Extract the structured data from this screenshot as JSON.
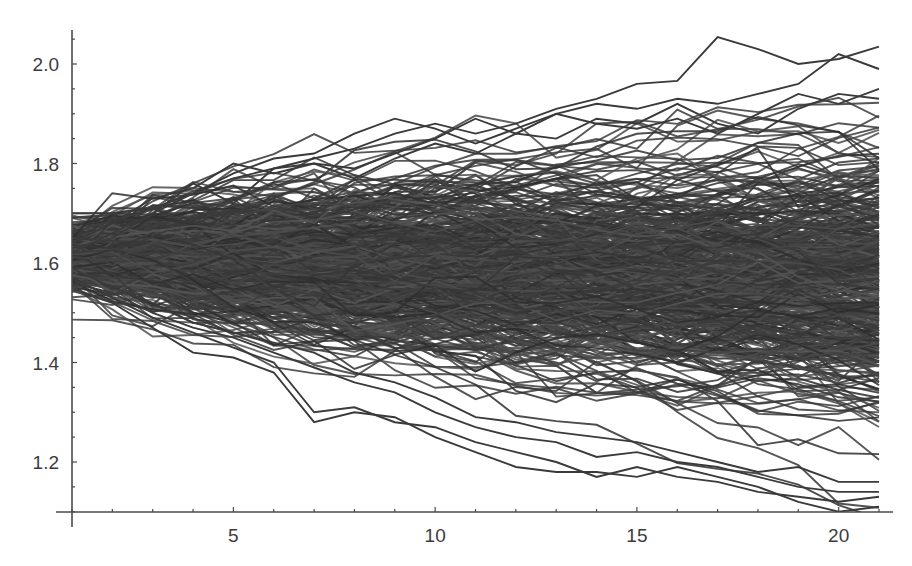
{
  "chart_data": {
    "type": "line",
    "title": "",
    "xlabel": "",
    "ylabel": "",
    "xlim": [
      1,
      21.2
    ],
    "ylim": [
      1.095,
      2.07
    ],
    "grid": false,
    "legend": null,
    "x_ticks": {
      "major": [
        5,
        10,
        15,
        20
      ],
      "major_labels": [
        "5",
        "10",
        "15",
        "20"
      ],
      "minor_step": 1
    },
    "y_ticks": {
      "major": [
        1.2,
        1.4,
        1.6,
        1.8,
        2.0
      ],
      "major_labels": [
        "1.2",
        "1.4",
        "1.6",
        "1.8",
        "2.0"
      ],
      "minor_step": 0.05
    },
    "x": [
      1,
      2,
      3,
      4,
      5,
      6,
      7,
      8,
      9,
      10,
      11,
      12,
      13,
      14,
      15,
      16,
      17,
      18,
      19,
      20,
      21
    ],
    "line_color": "#3a3a3a",
    "ensemble": {
      "n_paths": 480,
      "start_mean": 1.615,
      "start_sd": 0.028,
      "step_sd": 0.027,
      "drift": -0.002,
      "seed": 7
    },
    "envelope_band": {
      "upper_approx": [
        1.7,
        1.71,
        1.73,
        1.76,
        1.79,
        1.8,
        1.83,
        1.85,
        1.84,
        1.86,
        1.87,
        1.89,
        1.91,
        1.92,
        1.96,
        1.97,
        2.05,
        2.03,
        2.0,
        2.02,
        2.04
      ],
      "lower_approx": [
        1.53,
        1.5,
        1.46,
        1.42,
        1.41,
        1.38,
        1.28,
        1.3,
        1.27,
        1.24,
        1.22,
        1.19,
        1.19,
        1.18,
        1.17,
        1.16,
        1.15,
        1.14,
        1.12,
        1.1,
        1.11
      ]
    },
    "series": [
      {
        "name": "outlier-high-peak",
        "values": [
          1.62,
          1.66,
          1.7,
          1.74,
          1.77,
          1.79,
          1.81,
          1.83,
          1.86,
          1.88,
          1.86,
          1.88,
          1.91,
          1.93,
          1.96,
          1.966,
          2.054,
          2.03,
          2.0,
          2.01,
          2.035
        ]
      },
      {
        "name": "outlier-high-2",
        "values": [
          1.7,
          1.7,
          1.71,
          1.74,
          1.78,
          1.81,
          1.82,
          1.86,
          1.89,
          1.87,
          1.84,
          1.87,
          1.9,
          1.92,
          1.91,
          1.93,
          1.92,
          1.94,
          1.96,
          2.02,
          1.99
        ]
      },
      {
        "name": "outlier-high-3",
        "values": [
          1.64,
          1.68,
          1.73,
          1.75,
          1.8,
          1.78,
          1.8,
          1.79,
          1.82,
          1.85,
          1.89,
          1.86,
          1.9,
          1.88,
          1.87,
          1.89,
          1.86,
          1.9,
          1.94,
          1.92,
          1.95
        ]
      },
      {
        "name": "outlier-high-4",
        "values": [
          1.63,
          1.65,
          1.7,
          1.76,
          1.72,
          1.79,
          1.8,
          1.77,
          1.81,
          1.84,
          1.82,
          1.86,
          1.85,
          1.89,
          1.88,
          1.92,
          1.88,
          1.86,
          1.91,
          1.94,
          1.93
        ]
      },
      {
        "name": "outlier-low-1",
        "values": [
          1.55,
          1.52,
          1.47,
          1.42,
          1.41,
          1.38,
          1.28,
          1.3,
          1.29,
          1.25,
          1.22,
          1.19,
          1.18,
          1.18,
          1.17,
          1.19,
          1.17,
          1.15,
          1.12,
          1.1,
          1.11
        ]
      },
      {
        "name": "outlier-low-2",
        "values": [
          1.57,
          1.53,
          1.49,
          1.46,
          1.43,
          1.4,
          1.3,
          1.31,
          1.28,
          1.27,
          1.24,
          1.22,
          1.2,
          1.17,
          1.19,
          1.17,
          1.16,
          1.14,
          1.13,
          1.12,
          1.13
        ]
      },
      {
        "name": "outlier-low-3",
        "values": [
          1.56,
          1.54,
          1.5,
          1.47,
          1.45,
          1.42,
          1.39,
          1.36,
          1.34,
          1.3,
          1.27,
          1.25,
          1.24,
          1.21,
          1.22,
          1.2,
          1.19,
          1.17,
          1.15,
          1.14,
          1.14
        ]
      },
      {
        "name": "outlier-low-4",
        "values": [
          1.59,
          1.55,
          1.52,
          1.48,
          1.46,
          1.44,
          1.42,
          1.38,
          1.36,
          1.33,
          1.29,
          1.28,
          1.26,
          1.25,
          1.24,
          1.22,
          1.2,
          1.18,
          1.19,
          1.16,
          1.16
        ]
      }
    ]
  },
  "layout": {
    "plot_left_px": 72,
    "plot_right_px": 879,
    "x_axis_y_px": 512,
    "y_axis_top_px": 30,
    "x_px_per_unit": 40.35,
    "y_px_per_unit": 497.5,
    "y_ref_value": 2.0,
    "y_ref_px": 64
  }
}
